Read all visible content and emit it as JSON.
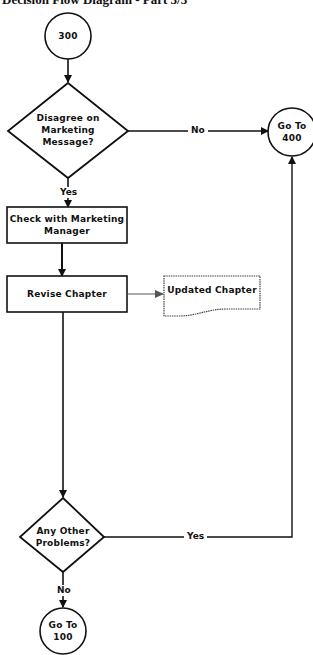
{
  "title": "Decision Flow Diagram - Part 3/3",
  "nodes": {
    "start": {
      "type": "connector-circle",
      "label": "300"
    },
    "decision1": {
      "type": "decision-diamond",
      "label": "Disagree on Marketing Message?"
    },
    "goto400": {
      "type": "connector-circle",
      "label": "Go To 400"
    },
    "process1": {
      "type": "process-box",
      "label": "Check with Marketing Manager"
    },
    "process2": {
      "type": "process-box",
      "label": "Revise Chapter"
    },
    "document1": {
      "type": "document",
      "label": "Updated Chapter"
    },
    "decision2": {
      "type": "decision-diamond",
      "label": "Any Other Problems?"
    },
    "goto100": {
      "type": "connector-circle",
      "label": "Go To 100"
    }
  },
  "edges": [
    {
      "from": "start",
      "to": "decision1",
      "label": ""
    },
    {
      "from": "decision1",
      "to": "goto400",
      "label": "No"
    },
    {
      "from": "decision1",
      "to": "process1",
      "label": "Yes"
    },
    {
      "from": "process1",
      "to": "process2",
      "label": ""
    },
    {
      "from": "process2",
      "to": "document1",
      "label": ""
    },
    {
      "from": "process2",
      "to": "decision2",
      "label": ""
    },
    {
      "from": "decision2",
      "to": "goto400",
      "label": "Yes"
    },
    {
      "from": "decision2",
      "to": "goto100",
      "label": "No"
    }
  ],
  "labels": {
    "start": "300",
    "decision1_line1": "Disagree on",
    "decision1_line2": "Marketing",
    "decision1_line3": "Message?",
    "goto400_line1": "Go To",
    "goto400_line2": "400",
    "process1_line1": "Check with Marketing",
    "process1_line2": "Manager",
    "process2": "Revise Chapter",
    "document1": "Updated Chapter",
    "decision2_line1": "Any Other",
    "decision2_line2": "Problems?",
    "goto100_line1": "Go To",
    "goto100_line2": "100",
    "edge_no_1": "No",
    "edge_yes_1": "Yes",
    "edge_yes_2": "Yes",
    "edge_no_2": "No"
  }
}
